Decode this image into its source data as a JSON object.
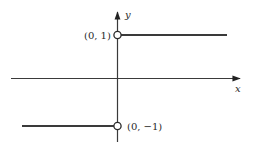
{
  "diagram": {
    "type": "piecewise-step-function-graph",
    "axes": {
      "x_label": "x",
      "y_label": "y"
    },
    "points": [
      {
        "label": "(0, 1)",
        "x": 0,
        "y": 1,
        "style": "open-circle"
      },
      {
        "label": "(0, −1)",
        "x": 0,
        "y": -1,
        "style": "open-circle"
      }
    ],
    "segments": [
      {
        "name": "upper-ray",
        "y": 1,
        "domain": "x > 0"
      },
      {
        "name": "lower-ray",
        "y": -1,
        "domain": "x < 0"
      }
    ],
    "colors": {
      "line": "#3a3a3a",
      "background": "#ffffff"
    }
  }
}
